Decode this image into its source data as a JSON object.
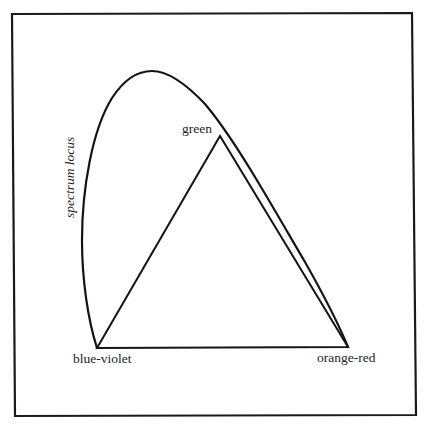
{
  "diagram": {
    "type": "chromaticity-diagram",
    "curve_label": "spectrum locus",
    "vertices": [
      {
        "id": "blue-violet",
        "label": "blue-violet",
        "x": 97,
        "y": 348
      },
      {
        "id": "green",
        "label": "green",
        "x": 220,
        "y": 136
      },
      {
        "id": "orange-red",
        "label": "orange-red",
        "x": 348,
        "y": 347
      }
    ],
    "labels": {
      "blue_violet": "blue-violet",
      "green": "green",
      "orange_red": "orange-red",
      "spectrum_locus": "spectrum locus"
    },
    "colors": {
      "line": "#141414",
      "background": "#ffffff"
    }
  }
}
